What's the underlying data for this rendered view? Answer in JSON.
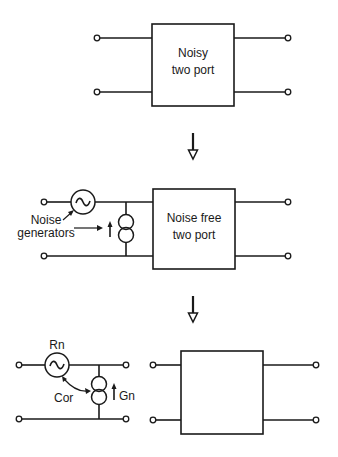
{
  "stage1": {
    "box_line1": "Noisy",
    "box_line2": "two port"
  },
  "stage2": {
    "box_line1": "Noise free",
    "box_line2": "two port",
    "annotation_line1": "Noise",
    "annotation_line2": "generators"
  },
  "stage3": {
    "voltage_source_label": "Rn",
    "current_source_label": "Gn",
    "correlation_label": "Cor"
  },
  "colors": {
    "line": "#1a1a1a",
    "background": "#ffffff"
  }
}
